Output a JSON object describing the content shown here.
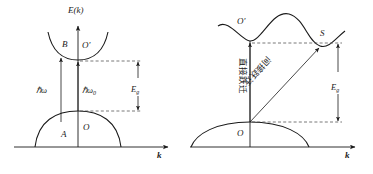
{
  "figure": {
    "stroke_color": "#1a1a1a",
    "dash_color": "#555555",
    "background": "#ffffff",
    "panels": [
      {
        "id": "left-panel",
        "name": "direct-transition-diagram",
        "axis_y_label": "E(k)",
        "axis_x_label": "k",
        "labels": {
          "valence_point_left": "A",
          "valence_point_origin": "O",
          "conduction_point_left": "B",
          "conduction_point_origin": "O′",
          "photon_energy_left": "ℏω",
          "photon_energy_center": "ℏω",
          "photon_energy_center_sub": "0",
          "gap_energy": "E",
          "gap_energy_sub": "g"
        }
      },
      {
        "id": "right-panel",
        "name": "indirect-transition-diagram",
        "axis_x_label": "k",
        "labels": {
          "valence_point_origin": "O",
          "conduction_point_origin": "O′",
          "conduction_point_side": "S",
          "direct_transition": "直接跃迁",
          "indirect_transition": "间接跃迁",
          "gap_energy": "E",
          "gap_energy_sub": "g"
        }
      }
    ]
  }
}
